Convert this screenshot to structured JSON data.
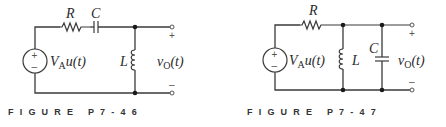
{
  "figures": [
    {
      "caption": "FIGURE P7-46",
      "topology": "series R-C, shunt L at output",
      "labels": {
        "resistor": "R",
        "capacitor": "C",
        "inductor": "L",
        "source_V": "V",
        "source_sub": "A",
        "source_tail": "u(t)",
        "output_v": "v",
        "output_sub": "O",
        "output_tail": "(t)",
        "plus": "+",
        "minus": "–",
        "src_plus": "+",
        "src_minus": "–"
      }
    },
    {
      "caption": "FIGURE P7-47",
      "topology": "series R, shunt L and shunt C at output",
      "labels": {
        "resistor": "R",
        "capacitor": "C",
        "inductor": "L",
        "source_V": "V",
        "source_sub": "A",
        "source_tail": "u(t)",
        "output_v": "v",
        "output_sub": "O",
        "output_tail": "(t)",
        "plus": "+",
        "minus": "–",
        "src_plus": "+",
        "src_minus": "–"
      }
    }
  ]
}
